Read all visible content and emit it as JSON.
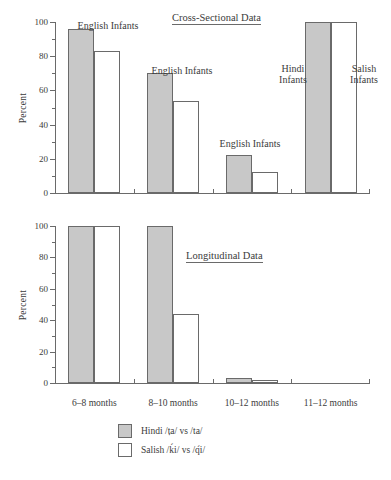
{
  "figure": {
    "ylabel": "Percent"
  },
  "legend": {
    "items": [
      {
        "swatch": "filled",
        "label": "Hindi /ṭa/ vs /ta/"
      },
      {
        "swatch": "open",
        "label": "Salish /ḱi/ vs /q́i/"
      }
    ]
  },
  "xaxis": {
    "tick_labels": [
      "6–8 months",
      "8–10 months",
      "10–12 months",
      "11–12 months"
    ]
  },
  "yaxis": {
    "tick_labels": [
      "0",
      "20",
      "40",
      "60",
      "80",
      "100"
    ]
  },
  "annotations": {
    "top": [
      "English Infants",
      "English Infants",
      "English Infants",
      "Hindi\nInfants",
      "Salish\nInfants"
    ],
    "top_1": "English Infants",
    "top_2": "English Infants",
    "top_3": "English Infants",
    "top_4": "Hindi\nInfants",
    "top_5": "Salish\nInfants"
  },
  "colors": {
    "bar_filled": "#c8c8c8",
    "bar_open": "#ffffff",
    "line": "#6a6a6a",
    "text": "#3b3b3b"
  },
  "chart_data": [
    {
      "type": "bar",
      "title": "Cross-Sectional Data",
      "xlabel": "",
      "ylabel": "Percent",
      "ylim": [
        0,
        100
      ],
      "yticks": [
        0,
        20,
        40,
        60,
        80,
        100
      ],
      "minor_tick_step": 10,
      "grid": false,
      "legend_position": "below-figure",
      "categories": [
        "6–8 months",
        "8–10 months",
        "10–12 months",
        "11–12 months"
      ],
      "series": [
        {
          "name": "Hindi /ṭa/ vs /ta/",
          "values": [
            96,
            70,
            22,
            100
          ]
        },
        {
          "name": "Salish /ḱi/ vs /q́i/",
          "values": [
            83,
            54,
            12,
            100
          ]
        }
      ],
      "annotations": [
        {
          "text": "English Infants",
          "category": "6–8 months"
        },
        {
          "text": "English Infants",
          "category": "8–10 months"
        },
        {
          "text": "English Infants",
          "category": "10–12 months"
        },
        {
          "text": "Hindi Infants",
          "category": "11–12 months"
        },
        {
          "text": "Salish Infants",
          "category": "11–12 months"
        }
      ]
    },
    {
      "type": "bar",
      "title": "Longitudinal Data",
      "xlabel": "",
      "ylabel": "Percent",
      "ylim": [
        0,
        100
      ],
      "yticks": [
        0,
        20,
        40,
        60,
        80,
        100
      ],
      "minor_tick_step": 10,
      "grid": false,
      "legend_position": "below-figure",
      "categories": [
        "6–8 months",
        "8–10 months",
        "10–12 months",
        "11–12 months"
      ],
      "series": [
        {
          "name": "Hindi /ṭa/ vs /ta/",
          "values": [
            100,
            100,
            3,
            0
          ]
        },
        {
          "name": "Salish /ḱi/ vs /q́i/",
          "values": [
            100,
            44,
            2,
            0
          ]
        }
      ],
      "annotations": []
    }
  ],
  "titles": {
    "top": "Cross-Sectional Data",
    "bottom": "Longitudinal Data"
  }
}
